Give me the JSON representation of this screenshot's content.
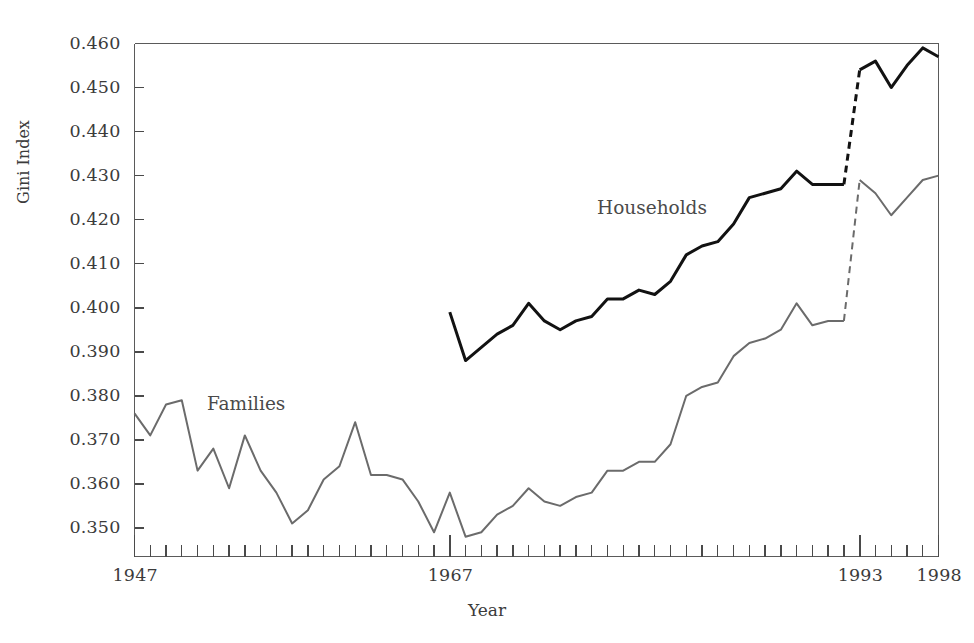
{
  "chart_data": {
    "type": "line",
    "title": "",
    "xlabel": "Year",
    "ylabel": "Gini Index",
    "xlim": [
      1947,
      1998
    ],
    "ylim": [
      0.3435,
      0.46
    ],
    "grid": false,
    "legend_position": "inline-annotations",
    "x_tick_labels": [
      "1947",
      "1967",
      "1993",
      "1998"
    ],
    "x_major_ticks": [
      1947,
      1967,
      1993,
      1998
    ],
    "x_minor_tick_step": 1,
    "y_tick_labels": [
      "0.350",
      "0.360",
      "0.370",
      "0.380",
      "0.390",
      "0.400",
      "0.410",
      "0.420",
      "0.430",
      "0.440",
      "0.450",
      "0.460"
    ],
    "y_ticks": [
      0.35,
      0.36,
      0.37,
      0.38,
      0.39,
      0.4,
      0.41,
      0.42,
      0.43,
      0.44,
      0.45,
      0.46
    ],
    "series": [
      {
        "name": "Families",
        "label": "Families",
        "color": "#6b6b6b",
        "width": 2.0,
        "x": [
          1947,
          1948,
          1949,
          1950,
          1951,
          1952,
          1953,
          1954,
          1955,
          1956,
          1957,
          1958,
          1959,
          1960,
          1961,
          1962,
          1963,
          1964,
          1965,
          1966,
          1967,
          1968,
          1969,
          1970,
          1971,
          1972,
          1973,
          1974,
          1975,
          1976,
          1977,
          1978,
          1979,
          1980,
          1981,
          1982,
          1983,
          1984,
          1985,
          1986,
          1987,
          1988,
          1989,
          1990,
          1991,
          1992
        ],
        "values": [
          0.376,
          0.371,
          0.378,
          0.379,
          0.363,
          0.368,
          0.359,
          0.371,
          0.363,
          0.358,
          0.351,
          0.354,
          0.361,
          0.364,
          0.374,
          0.362,
          0.362,
          0.361,
          0.356,
          0.349,
          0.358,
          0.348,
          0.349,
          0.353,
          0.355,
          0.359,
          0.356,
          0.355,
          0.357,
          0.358,
          0.363,
          0.363,
          0.365,
          0.365,
          0.369,
          0.38,
          0.382,
          0.383,
          0.389,
          0.392,
          0.393,
          0.395,
          0.401,
          0.396,
          0.397,
          0.397
        ],
        "dashed_x": [
          1992,
          1993
        ],
        "dashed_values": [
          0.397,
          0.429
        ],
        "x_post": [
          1993,
          1994,
          1995,
          1996,
          1997,
          1998
        ],
        "values_post": [
          0.429,
          0.426,
          0.421,
          0.425,
          0.429,
          0.43
        ]
      },
      {
        "name": "Households",
        "label": "Households",
        "color": "#121212",
        "width": 3.0,
        "x": [
          1967,
          1968,
          1969,
          1970,
          1971,
          1972,
          1973,
          1974,
          1975,
          1976,
          1977,
          1978,
          1979,
          1980,
          1981,
          1982,
          1983,
          1984,
          1985,
          1986,
          1987,
          1988,
          1989,
          1990,
          1991,
          1992
        ],
        "values": [
          0.399,
          0.388,
          0.391,
          0.394,
          0.396,
          0.401,
          0.397,
          0.395,
          0.397,
          0.398,
          0.402,
          0.402,
          0.404,
          0.403,
          0.406,
          0.412,
          0.414,
          0.415,
          0.419,
          0.425,
          0.426,
          0.427,
          0.431,
          0.428,
          0.428,
          0.428
        ],
        "dashed_x": [
          1992,
          1993
        ],
        "dashed_values": [
          0.428,
          0.454
        ],
        "x_post": [
          1993,
          1994,
          1995,
          1996,
          1997,
          1998
        ],
        "values_post": [
          0.454,
          0.456,
          0.45,
          0.455,
          0.459,
          0.457
        ]
      }
    ],
    "annotations": [
      {
        "text": "Households",
        "x": 1978,
        "y": 0.4215
      },
      {
        "text": "Families",
        "x": 1951.5,
        "y": 0.3785
      }
    ],
    "axis": {
      "box_color": "#5a5a5a",
      "tick_color": "#4a4a4a"
    }
  }
}
